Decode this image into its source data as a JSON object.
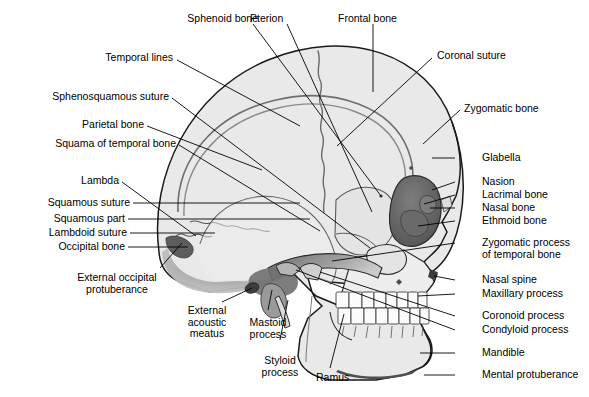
{
  "figure": {
    "background_color": "#ffffff",
    "bone_fill": "#e9e9e9",
    "bone_fill_dark": "#8d8d8d",
    "bone_fill_mid": "#b9b9b9",
    "orbit_fill": "#6f6f6f",
    "outline_color": "#1a1a1a",
    "leader_color": "#000000",
    "text_color": "#000000"
  },
  "labels": {
    "sphenoid_bone": "Sphenoid bone",
    "pterion": "Pterion",
    "frontal_bone": "Frontal bone",
    "coronal_suture": "Coronal suture",
    "temporal_lines": "Temporal lines",
    "sphenosquamous_suture": "Sphenosquamous suture",
    "parietal_bone": "Parietal bone",
    "squama_of_temporal_bone": "Squama of temporal bone",
    "lambda": "Lambda",
    "squamous_suture": "Squamous suture",
    "squamous_part": "Squamous part",
    "lambdoid_suture": "Lambdoid suture",
    "occipital_bone": "Occipital bone",
    "external_occipital_protuberance_line1": "External occipital",
    "external_occipital_protuberance_line2": "protuberance",
    "external_acoustic_meatus_line1": "External",
    "external_acoustic_meatus_line2": "acoustic",
    "external_acoustic_meatus_line3": "meatus",
    "mastoid_process_line1": "Mastoid",
    "mastoid_process_line2": "process",
    "styloid_process_line1": "Styloid",
    "styloid_process_line2": "process",
    "ramus": "Ramus",
    "zygomatic_bone": "Zygomatic bone",
    "glabella": "Glabella",
    "nasion": "Nasion",
    "lacrimal_bone": "Lacrimal bone",
    "nasal_bone": "Nasal bone",
    "ethmoid_bone": "Ethmoid bone",
    "zygomatic_process_line1": "Zygomatic process",
    "zygomatic_process_line2": "of temporal bone",
    "nasal_spine": "Nasal spine",
    "maxillary_process": "Maxillary process",
    "coronoid_process": "Coronoid process",
    "condyloid_process": "Condyloid process",
    "mandible": "Mandible",
    "mental_protuberance": "Mental protuberance"
  }
}
